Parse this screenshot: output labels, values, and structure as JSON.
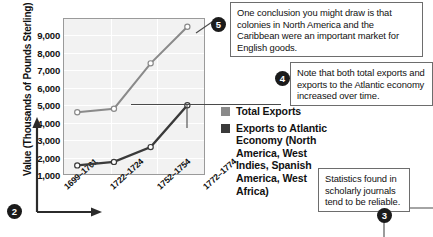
{
  "chart_data": {
    "type": "line",
    "title": "",
    "xlabel": "",
    "ylabel": "Value (Thousands of Pounds Sterling)",
    "categories": [
      "1699–1701",
      "1722–1724",
      "1752–1754",
      "1772–1774"
    ],
    "ylim": [
      0,
      9000
    ],
    "yticks": [
      "1,000",
      "2,000",
      "3,000",
      "4,000",
      "5,000",
      "6,000",
      "7,000",
      "8,000",
      "9,000"
    ],
    "ytick_values": [
      1000,
      2000,
      3000,
      4000,
      5000,
      6000,
      7000,
      8000,
      9000
    ],
    "grid": true,
    "legend_position": "right",
    "series": [
      {
        "name": "Total Exports",
        "color": "#8a8a8a",
        "values": [
          3600,
          3800,
          6400,
          8500
        ]
      },
      {
        "name": "Exports to Atlantic Economy (North America, West Indies, Spanish America, West Africa)",
        "color": "#3a3a3a",
        "values": [
          550,
          750,
          1600,
          4000
        ]
      }
    ]
  },
  "legend": {
    "items": [
      {
        "label": "Total Exports",
        "color": "#8a8a8a"
      },
      {
        "label": "Exports to Atlantic Economy (North America, West Indies, Spanish America, West Africa)",
        "color": "#3a3a3a"
      }
    ]
  },
  "callouts": [
    {
      "number": "5",
      "text": "One conclusion you might draw is that colonies in North America and the Caribbean were an important market for English goods."
    },
    {
      "number": "4",
      "text": "Note that both total exports and exports to the Atlantic economy increased over time."
    },
    {
      "number": "3",
      "text": "Statistics found in scholarly journals tend to be reliable."
    }
  ],
  "markers": {
    "axes_marker": "2"
  },
  "colors": {
    "plot_background": "#f2f2f2",
    "plot_border": "#9a9a9a",
    "gridline": "#ffffff",
    "total_exports": "#8a8a8a",
    "atlantic_exports": "#3a3a3a",
    "bullet_fill": "#1b1b1b",
    "callout_border": "#6d6d6d"
  }
}
